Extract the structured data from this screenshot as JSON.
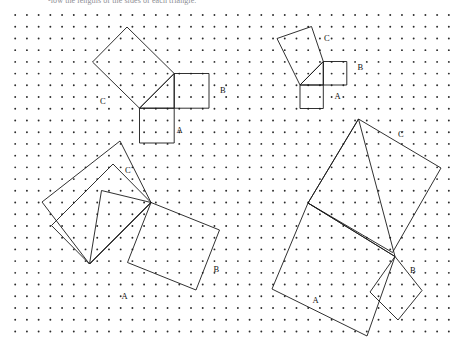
{
  "document": {
    "header_text": "-low the lengths of the sides of each triangle.",
    "background_color": "#ffffff",
    "ink_color": "#1a1a1a",
    "dot_color": "#2b2b2b",
    "width": 459,
    "height": 347
  },
  "grid": {
    "name": "dot-grid",
    "origin_x": 15.2,
    "origin_y": 15.0,
    "spacing": 11.72,
    "cols": 38,
    "rows": 28,
    "dot_radius": 0.95
  },
  "figures": [
    {
      "id": "figure-1",
      "label": "top-left-figure",
      "triangle": [
        [
          139.5,
          108.2
        ],
        [
          174.2,
          108.2
        ],
        [
          174.2,
          73.5
        ]
      ],
      "squares": {
        "A": {
          "points": [
            [
              139.5,
              108.2
            ],
            [
              174.2,
              108.2
            ],
            [
              174.2,
              143.0
            ],
            [
              139.5,
              143.0
            ]
          ],
          "label": "A",
          "label_x": 176.5,
          "label_y": 133.0
        },
        "B": {
          "points": [
            [
              174.2,
              108.2
            ],
            [
              174.2,
              73.5
            ],
            [
              209.0,
              73.5
            ],
            [
              209.0,
              108.2
            ]
          ],
          "label": "B",
          "label_x": 220.0,
          "label_y": 93.0
        },
        "C": {
          "points": [
            [
              139.5,
              108.2
            ],
            [
              174.2,
              73.5
            ],
            [
              127.0,
              27.0
            ],
            [
              92.5,
              62.0
            ]
          ],
          "label": "C",
          "label_x": 100.0,
          "label_y": 103.5
        }
      }
    },
    {
      "id": "figure-2",
      "label": "top-right-figure",
      "triangle": [
        [
          300.0,
          85.0
        ],
        [
          323.3,
          85.0
        ],
        [
          323.3,
          61.5
        ]
      ],
      "squares": {
        "A": {
          "points": [
            [
              300.0,
              85.0
            ],
            [
              323.3,
              85.0
            ],
            [
              323.3,
              108.5
            ],
            [
              300.0,
              108.5
            ]
          ],
          "label": "A",
          "label_x": 334.5,
          "label_y": 98.5
        },
        "B": {
          "points": [
            [
              323.3,
              85.0
            ],
            [
              323.3,
              61.5
            ],
            [
              346.8,
              61.5
            ],
            [
              346.8,
              85.0
            ]
          ],
          "label": "B",
          "label_x": 357.5,
          "label_y": 70.0
        },
        "C": {
          "points": [
            [
              300.0,
              85.0
            ],
            [
              323.3,
              61.5
            ],
            [
              311.5,
              26.5
            ],
            [
              277.0,
              38.5
            ]
          ],
          "label": "C",
          "label_x": 324.0,
          "label_y": 40.5
        }
      }
    },
    {
      "id": "figure-3",
      "label": "bottom-left-figure",
      "triangle": [
        [
          89.5,
          264.0
        ],
        [
          151.0,
          202.5
        ],
        [
          101.5,
          190.5
        ]
      ],
      "squares": {
        "A": {
          "points": [
            [
              89.5,
              264.0
            ],
            [
              151.0,
              202.5
            ],
            [
              113.0,
              164.0
            ],
            [
              51.5,
              225.5
            ]
          ],
          "label": "A",
          "label_x": 121.5,
          "label_y": 299.0
        },
        "B": {
          "points": [
            [
              151.0,
              202.5
            ],
            [
              219.5,
              230.0
            ],
            [
              196.0,
              290.0
            ],
            [
              127.5,
              262.5
            ]
          ],
          "label": "B",
          "label_x": 213.5,
          "label_y": 272.0
        },
        "C": {
          "points": [
            [
              89.5,
              264.0
            ],
            [
              151.0,
              202.5
            ],
            [
              120.0,
              141.0
            ],
            [
              42.0,
              202.0
            ]
          ],
          "label": "C",
          "label_x": 125.0,
          "label_y": 173.0
        }
      }
    },
    {
      "id": "figure-4",
      "label": "bottom-right-figure",
      "triangle": [
        [
          308.0,
          203.0
        ],
        [
          395.0,
          256.5
        ],
        [
          358.5,
          119.0
        ]
      ],
      "squares": {
        "A": {
          "points": [
            [
              308.0,
              203.0
            ],
            [
              395.0,
              256.5
            ],
            [
              367.0,
              336.0
            ],
            [
              272.0,
              289.0
            ]
          ],
          "label": "A",
          "label_x": 312.5,
          "label_y": 303.0
        },
        "B": {
          "points": [
            [
              395.0,
              256.5
            ],
            [
              422.0,
              290.5
            ],
            [
              398.0,
              320.0
            ],
            [
              370.0,
              292.0
            ]
          ],
          "label": "B",
          "label_x": 410.0,
          "label_y": 272.5
        },
        "C": {
          "points": [
            [
              308.0,
              203.0
            ],
            [
              358.5,
              119.0
            ],
            [
              441.0,
              168.0
            ],
            [
              392.5,
              252.5
            ]
          ],
          "label": "C",
          "label_x": 398.0,
          "label_y": 137.0
        }
      }
    }
  ],
  "square_labels": [
    "A",
    "B",
    "C"
  ]
}
